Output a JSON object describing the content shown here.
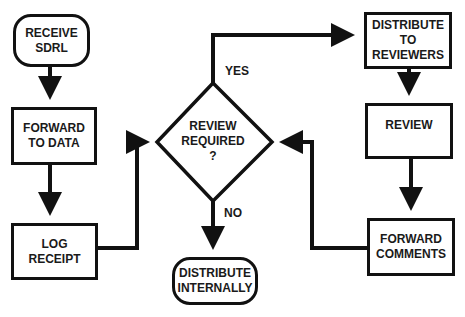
{
  "diagram": {
    "type": "flowchart",
    "colors": {
      "stroke": "#111111",
      "text": "#1a1a1a",
      "background": "#ffffff"
    },
    "nodes": {
      "receive_sdrl": {
        "lines": [
          "RECEIVE",
          "SDRL"
        ],
        "shape": "rounded-rect"
      },
      "forward_to_data": {
        "lines": [
          "FORWARD",
          "TO DATA"
        ],
        "shape": "rect"
      },
      "log_receipt": {
        "lines": [
          "LOG",
          "RECEIPT"
        ],
        "shape": "rect"
      },
      "review_required": {
        "lines": [
          "REVIEW",
          "REQUIRED",
          "?"
        ],
        "shape": "diamond"
      },
      "distribute_internally": {
        "lines": [
          "DISTRIBUTE",
          "INTERNALLY"
        ],
        "shape": "rounded-rect"
      },
      "distribute_to_reviewers": {
        "lines": [
          "DISTRIBUTE",
          "TO",
          "REVIEWERS"
        ],
        "shape": "rect"
      },
      "review": {
        "lines": [
          "REVIEW"
        ],
        "shape": "rect"
      },
      "forward_comments": {
        "lines": [
          "FORWARD",
          "COMMENTS"
        ],
        "shape": "rect"
      }
    },
    "edge_labels": {
      "yes": "YES",
      "no": "NO"
    },
    "edges": [
      {
        "from": "RECEIVE SDRL",
        "to": "FORWARD TO DATA"
      },
      {
        "from": "FORWARD TO DATA",
        "to": "LOG RECEIPT"
      },
      {
        "from": "LOG RECEIPT",
        "to": "REVIEW REQUIRED ?"
      },
      {
        "from": "REVIEW REQUIRED ?",
        "to": "DISTRIBUTE TO REVIEWERS",
        "label": "YES"
      },
      {
        "from": "REVIEW REQUIRED ?",
        "to": "DISTRIBUTE INTERNALLY",
        "label": "NO"
      },
      {
        "from": "DISTRIBUTE TO REVIEWERS",
        "to": "REVIEW"
      },
      {
        "from": "REVIEW",
        "to": "FORWARD COMMENTS"
      },
      {
        "from": "FORWARD COMMENTS",
        "to": "REVIEW REQUIRED ?"
      }
    ]
  }
}
